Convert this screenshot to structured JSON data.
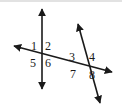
{
  "figure": {
    "canvas": {
      "width": 122,
      "height": 110
    },
    "background_color": "#ffffff",
    "top_edge_color": "#e2e2e2",
    "stroke_color": "#1a1a1a",
    "stroke_width": 1.6
  },
  "lines": [
    {
      "name": "vertical-line",
      "from": {
        "x": 42,
        "y": 9
      },
      "to": {
        "x": 42,
        "y": 89
      },
      "arrows": "both"
    },
    {
      "name": "transversal-line",
      "from": {
        "x": 14,
        "y": 46
      },
      "to": {
        "x": 112,
        "y": 72
      },
      "arrows": "both"
    },
    {
      "name": "slanted-line",
      "from": {
        "x": 78,
        "y": 24
      },
      "to": {
        "x": 100,
        "y": 103
      },
      "arrows": "both"
    }
  ],
  "intersections": [
    {
      "name": "left-intersection",
      "x": 42,
      "y": 54
    },
    {
      "name": "right-intersection",
      "x": 86,
      "y": 66
    }
  ],
  "angle_labels": [
    {
      "id": "angle-1",
      "text": "1",
      "x": 31,
      "y": 40,
      "position": "upper-left-of-left-intersection"
    },
    {
      "id": "angle-2",
      "text": "2",
      "x": 45,
      "y": 40,
      "position": "upper-right-of-left-intersection"
    },
    {
      "id": "angle-5",
      "text": "5",
      "x": 30,
      "y": 57,
      "position": "lower-left-of-left-intersection"
    },
    {
      "id": "angle-6",
      "text": "6",
      "x": 45,
      "y": 57,
      "position": "lower-right-of-left-intersection"
    },
    {
      "id": "angle-3",
      "text": "3",
      "x": 69,
      "y": 51,
      "position": "upper-left-of-right-intersection"
    },
    {
      "id": "angle-4",
      "text": "4",
      "x": 89,
      "y": 51,
      "position": "upper-right-of-right-intersection"
    },
    {
      "id": "angle-7",
      "text": "7",
      "x": 70,
      "y": 68,
      "position": "lower-left-of-right-intersection"
    },
    {
      "id": "angle-8",
      "text": "8",
      "x": 89,
      "y": 69,
      "position": "lower-right-of-right-intersection"
    }
  ]
}
